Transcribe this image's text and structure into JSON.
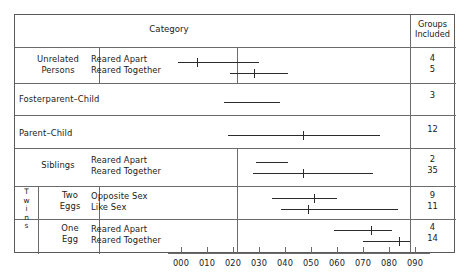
{
  "figure": {
    "headers": {
      "category": "Category",
      "groups_included": "Groups\nIncluded"
    },
    "axis": {
      "ticks": [
        {
          "label": "000",
          "value": 0.0
        },
        {
          "label": "010",
          "value": 0.1
        },
        {
          "label": "020",
          "value": 0.2
        },
        {
          "label": "030",
          "value": 0.3
        },
        {
          "label": "040",
          "value": 0.4
        },
        {
          "label": "050",
          "value": 0.5
        },
        {
          "label": "060",
          "value": 0.6
        },
        {
          "label": "070",
          "value": 0.7
        },
        {
          "label": "080",
          "value": 0.8
        },
        {
          "label": "090",
          "value": 0.9
        }
      ]
    },
    "rows": [
      {
        "group": "Unrelated\nPersons",
        "group_line1": "Unrelated",
        "group_line2": "Persons",
        "subrows": [
          {
            "label": "Reared Apart",
            "groups": "4"
          },
          {
            "label": "Reared Together",
            "groups": "5"
          }
        ]
      },
      {
        "group": "Fosterparent–Child",
        "subrows": [
          {
            "label": "",
            "groups": "3"
          }
        ]
      },
      {
        "group": "Parent–Child",
        "subrows": [
          {
            "label": "",
            "groups": "12"
          }
        ]
      },
      {
        "group": "Siblings",
        "subrows": [
          {
            "label": "Reared Apart",
            "groups": "2"
          },
          {
            "label": "Reared Together",
            "groups": "35"
          }
        ]
      },
      {
        "group": "Twins",
        "group_letters": [
          "T",
          "w",
          "i",
          "n",
          "s"
        ],
        "subgroup": "Two\nEggs",
        "subgroup_line1": "Two",
        "subgroup_line2": "Eggs",
        "subrows": [
          {
            "label": "Opposite Sex",
            "groups": "9"
          },
          {
            "label": "Like Sex",
            "groups": "11"
          }
        ]
      },
      {
        "subgroup": "One\nEgg",
        "subgroup_line1": "One",
        "subgroup_line2": "Egg",
        "subrows": [
          {
            "label": "Reared Apart",
            "groups": "4"
          },
          {
            "label": "Reared Together",
            "groups": "14"
          }
        ]
      }
    ]
  },
  "chart_data": {
    "type": "range-plot",
    "title": "Category",
    "xlabel": "",
    "ylabel": "",
    "xlim": [
      0.0,
      0.95
    ],
    "grid": false,
    "legend": "none",
    "xtick_labels": [
      "000",
      "010",
      "020",
      "030",
      "040",
      "050",
      "060",
      "070",
      "080",
      "090"
    ],
    "xtick_values": [
      0.0,
      0.1,
      0.2,
      0.3,
      0.4,
      0.5,
      0.6,
      0.7,
      0.8,
      0.9
    ],
    "series": [
      {
        "category": "Unrelated Persons",
        "subcategory": "Reared Apart",
        "range_low": -0.01,
        "range_high": 0.3,
        "median": 0.06,
        "groups_included": 4
      },
      {
        "category": "Unrelated Persons",
        "subcategory": "Reared Together",
        "range_low": 0.19,
        "range_high": 0.41,
        "median": 0.28,
        "groups_included": 5
      },
      {
        "category": "Fosterparent-Child",
        "subcategory": "",
        "range_low": 0.165,
        "range_high": 0.38,
        "median": null,
        "groups_included": 3
      },
      {
        "category": "Parent-Child",
        "subcategory": "",
        "range_low": 0.18,
        "range_high": 0.765,
        "median": 0.47,
        "groups_included": 12
      },
      {
        "category": "Siblings",
        "subcategory": "Reared Apart",
        "range_low": 0.29,
        "range_high": 0.41,
        "median": null,
        "groups_included": 2
      },
      {
        "category": "Siblings",
        "subcategory": "Reared Together",
        "range_low": 0.275,
        "range_high": 0.74,
        "median": 0.47,
        "groups_included": 35
      },
      {
        "category": "Twins - Two Eggs",
        "subcategory": "Opposite Sex",
        "range_low": 0.35,
        "range_high": 0.6,
        "median": 0.51,
        "groups_included": 9
      },
      {
        "category": "Twins - Two Eggs",
        "subcategory": "Like Sex",
        "range_low": 0.385,
        "range_high": 0.835,
        "median": 0.49,
        "groups_included": 11
      },
      {
        "category": "Twins - One Egg",
        "subcategory": "Reared Apart",
        "range_low": 0.59,
        "range_high": 0.81,
        "median": 0.73,
        "groups_included": 4
      },
      {
        "category": "Twins - One Egg",
        "subcategory": "Reared Together",
        "range_low": 0.7,
        "range_high": 0.88,
        "median": 0.84,
        "groups_included": 14
      }
    ]
  },
  "geometry": {
    "x0_px": 181,
    "px_per_unit": 260,
    "bar_y": [
      62,
      73,
      102,
      135,
      162,
      173,
      198,
      209,
      230,
      241
    ]
  }
}
